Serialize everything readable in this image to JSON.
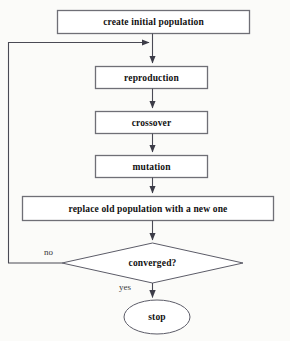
{
  "diagram": {
    "colors": {
      "background": "#fbfbf9",
      "node_fill": "#ffffff",
      "node_border": "#6f6f76",
      "connector": "#4a4a55",
      "text": "#111111",
      "edge_label_text": "#3a3a3a"
    },
    "nodes": [
      {
        "id": "create-initial-population",
        "shape": "rectangle",
        "label": "create initial population",
        "x": 57,
        "y": 10,
        "width": 193,
        "height": 24
      },
      {
        "id": "reproduction",
        "shape": "rectangle",
        "label": "reproduction",
        "x": 95,
        "y": 66,
        "width": 113,
        "height": 23
      },
      {
        "id": "crossover",
        "shape": "rectangle",
        "label": "crossover",
        "x": 95,
        "y": 111,
        "width": 113,
        "height": 23
      },
      {
        "id": "mutation",
        "shape": "rectangle",
        "label": "mutation",
        "x": 95,
        "y": 155,
        "width": 113,
        "height": 23
      },
      {
        "id": "replace-old-population",
        "shape": "rectangle",
        "label": "replace old population with a new one",
        "x": 22,
        "y": 196,
        "width": 252,
        "height": 25
      },
      {
        "id": "converged",
        "shape": "diamond",
        "label": "converged?",
        "x": 62,
        "y": 243,
        "width": 181,
        "height": 40
      },
      {
        "id": "stop",
        "shape": "ellipse",
        "label": "stop",
        "x": 124,
        "y": 300,
        "width": 66,
        "height": 34
      }
    ],
    "edges": [
      {
        "id": "edge-create-to-reproduction",
        "from": "create-initial-population",
        "to": "reproduction",
        "label": ""
      },
      {
        "id": "edge-reproduction-to-crossover",
        "from": "reproduction",
        "to": "crossover",
        "label": ""
      },
      {
        "id": "edge-crossover-to-mutation",
        "from": "crossover",
        "to": "mutation",
        "label": ""
      },
      {
        "id": "edge-mutation-to-replace",
        "from": "mutation",
        "to": "replace-old-population",
        "label": ""
      },
      {
        "id": "edge-replace-to-converged",
        "from": "replace-old-population",
        "to": "converged",
        "label": ""
      },
      {
        "id": "edge-converged-no-loop",
        "from": "converged",
        "to": "reproduction",
        "label": "no"
      },
      {
        "id": "edge-converged-yes-stop",
        "from": "converged",
        "to": "stop",
        "label": "yes"
      }
    ],
    "edge_labels": {
      "no": "no",
      "yes": "yes"
    }
  }
}
